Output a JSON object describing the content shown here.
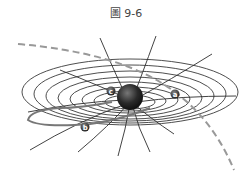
{
  "figure": {
    "title": "圖 9-6",
    "objects": [
      {
        "id": "a",
        "label": "a"
      },
      {
        "id": "b",
        "label": "b"
      },
      {
        "id": "c",
        "label": "c"
      }
    ],
    "colors": {
      "grid": "#3a3a3a",
      "mass": "#2a2a2a",
      "dashed_path": "#999999",
      "orbit_path": "#777777"
    }
  }
}
